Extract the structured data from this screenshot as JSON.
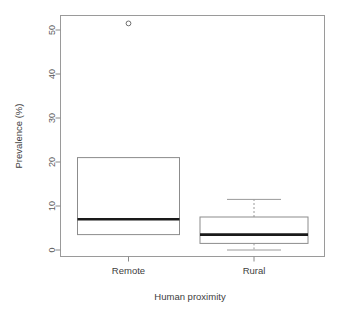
{
  "chart_data": {
    "type": "box",
    "title": "",
    "xlabel": "Human proximity",
    "ylabel": "Prevalence (%)",
    "categories": [
      "Remote",
      "Rural"
    ],
    "ytick_labels": [
      "0",
      "10",
      "20",
      "30",
      "40",
      "50"
    ],
    "ytick_values": [
      0,
      10,
      20,
      30,
      40,
      50
    ],
    "ylim": [
      -1.5,
      53.5
    ],
    "grid": false,
    "legend": false,
    "boxes": [
      {
        "name": "Remote",
        "whisker_low": 3.5,
        "q1": 3.5,
        "median": 7.0,
        "q3": 21.0,
        "whisker_high": 21.0,
        "outliers": [
          51.5
        ]
      },
      {
        "name": "Rural",
        "whisker_low": 0.0,
        "q1": 1.5,
        "median": 3.5,
        "q3": 7.5,
        "whisker_high": 11.5,
        "outliers": []
      }
    ],
    "colors": {
      "frame": "#9a9a9a",
      "box_stroke": "#8c8c8c",
      "box_fill": "#ffffff",
      "median": "#1a1a1a",
      "whisker": "#9a9a9a",
      "outlier": "#6e6e6e",
      "text": "#3d3d3d",
      "background": "#ffffff"
    }
  }
}
